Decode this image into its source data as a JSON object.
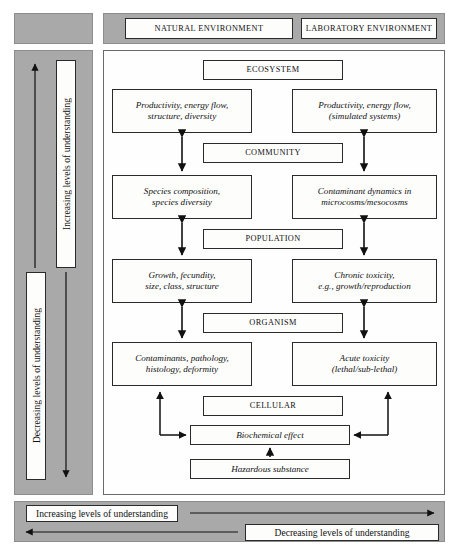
{
  "header": {
    "natural_label": "NATURAL ENVIRONMENT",
    "laboratory_label": "LABORATORY ENVIRONMENT"
  },
  "sidebar": {
    "increasing_label": "Increasing levels of understanding",
    "decreasing_label": "Decreasing levels of understanding"
  },
  "footer": {
    "increasing_label": "Increasing levels of understanding",
    "decreasing_label": "Decreasing levels of understanding"
  },
  "diagram": {
    "stages": [
      {
        "label": "ECOSYSTEM"
      },
      {
        "label": "COMMUNITY"
      },
      {
        "label": "POPULATION"
      },
      {
        "label": "ORGANISM"
      },
      {
        "label": "CELLULAR"
      }
    ],
    "natural_column": [
      {
        "line1": "Productivity, energy flow,",
        "line2": "structure, diversity"
      },
      {
        "line1": "Species composition,",
        "line2": "species diversity"
      },
      {
        "line1": "Growth, fecundity,",
        "line2": "size, class, structure"
      },
      {
        "line1": "Contaminants, pathology,",
        "line2": "histology, deformity"
      }
    ],
    "laboratory_column": [
      {
        "line1": "Productivity, energy flow,",
        "line2": "(simulated systems)"
      },
      {
        "line1": "Contaminant dynamics in",
        "line2": "microcosms/mesocosms"
      },
      {
        "line1": "Chronic toxicity,",
        "line2": "e.g., growth/reproduction"
      },
      {
        "line1": "Acute toxicity",
        "line2": "(lethal/sub-lethal)"
      }
    ],
    "biochemical_label": "Biochemical effect",
    "hazardous_label": "Hazardous substance"
  },
  "colors": {
    "gray_panel": "#a9a9a9",
    "box_border": "#2a2a2a",
    "box_fill": "#fdfdfc",
    "arrow": "#111111"
  }
}
